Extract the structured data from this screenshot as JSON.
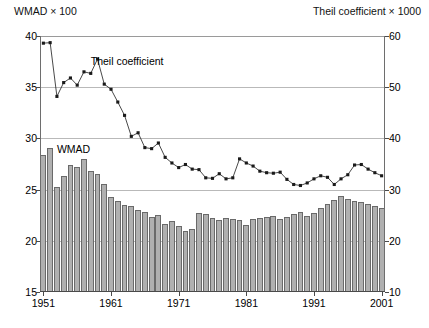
{
  "axes": {
    "left_caption": "WMAD × 100",
    "right_caption": "Theil coefficient × 1000",
    "left_ticks": [
      "15",
      "20",
      "25",
      "30",
      "35",
      "40"
    ],
    "right_ticks": [
      "10",
      "20",
      "30",
      "40",
      "50",
      "60"
    ],
    "x_ticks": [
      "1951",
      "1961",
      "1971",
      "1981",
      "1991",
      "2001"
    ]
  },
  "annotations": {
    "theil_label": "Theil coefficient",
    "wmad_label": "WMAD"
  },
  "colors": {
    "bar_fill": "#b0b0b0",
    "bar_stroke": "#6a6a6a",
    "line": "#1a1a1a",
    "marker": "#1a1a1a",
    "grid": "#b9b9b9",
    "axis": "#4a4a4a"
  },
  "chart_data": {
    "type": "bar",
    "title": "",
    "subtitle": "",
    "xlabel": "",
    "ylabel": "WMAD × 100",
    "y2label": "Theil coefficient × 1000",
    "ylim": [
      15,
      40
    ],
    "y2lim": [
      10,
      60
    ],
    "ytick_step": 5,
    "y2tick_step": 10,
    "grid": true,
    "grid_axis": "y",
    "legend": "none",
    "legend_position": "inline-annotations",
    "x": [
      1951,
      1952,
      1953,
      1954,
      1955,
      1956,
      1957,
      1958,
      1959,
      1960,
      1961,
      1962,
      1963,
      1964,
      1965,
      1966,
      1967,
      1968,
      1969,
      1970,
      1971,
      1972,
      1973,
      1974,
      1975,
      1976,
      1977,
      1978,
      1979,
      1980,
      1981,
      1982,
      1983,
      1984,
      1985,
      1986,
      1987,
      1988,
      1989,
      1990,
      1991,
      1992,
      1993,
      1994,
      1995,
      1996,
      1997,
      1998,
      1999,
      2000,
      2001
    ],
    "xlim": [
      1951,
      2001
    ],
    "xtick_labels": [
      "1951",
      "1961",
      "1971",
      "1981",
      "1991",
      "2001"
    ],
    "series": [
      {
        "name": "WMAD",
        "type": "bar",
        "axis": "left",
        "units": "WMAD × 100",
        "values": [
          28.4,
          29.1,
          25.3,
          26.3,
          27.4,
          27.2,
          28.0,
          26.8,
          26.5,
          25.5,
          24.3,
          23.9,
          23.5,
          23.4,
          23.0,
          22.8,
          22.3,
          22.5,
          21.6,
          21.9,
          21.4,
          21.0,
          21.2,
          22.7,
          22.6,
          22.2,
          22.0,
          22.2,
          22.1,
          22.0,
          21.5,
          22.1,
          22.2,
          22.3,
          22.4,
          22.1,
          22.3,
          22.6,
          22.8,
          22.4,
          22.7,
          23.2,
          23.6,
          24.0,
          24.4,
          24.1,
          23.9,
          23.8,
          23.6,
          23.4,
          23.2
        ]
      },
      {
        "name": "Theil coefficient",
        "type": "line",
        "axis": "right",
        "units": "Theil coefficient × 1000",
        "marker": "square",
        "values": [
          58.6,
          58.7,
          48.2,
          50.9,
          51.8,
          50.4,
          53.0,
          52.7,
          55.5,
          50.6,
          49.6,
          47.1,
          44.5,
          40.4,
          41.1,
          38.2,
          38.0,
          39.1,
          36.3,
          35.2,
          34.3,
          34.9,
          34.0,
          33.9,
          32.3,
          32.2,
          33.1,
          32.1,
          32.3,
          36.0,
          35.2,
          34.6,
          33.6,
          33.3,
          33.2,
          33.4,
          32.0,
          31.0,
          30.8,
          31.3,
          32.1,
          32.7,
          32.4,
          31.0,
          32.1,
          32.9,
          34.8,
          34.9,
          34.0,
          33.3,
          32.7
        ]
      }
    ]
  }
}
